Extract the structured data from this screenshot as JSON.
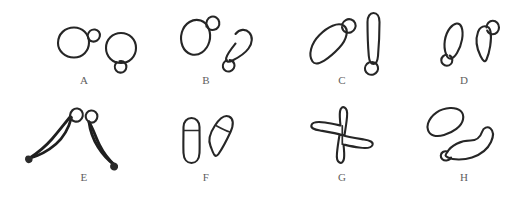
{
  "figure": {
    "background_color": "#ffffff",
    "ink_color": "#262626",
    "label_color": "#5e5e5e",
    "width": 530,
    "height": 197,
    "grid": {
      "rows": 2,
      "columns": 4
    }
  },
  "panels": [
    {
      "id": "A",
      "label": "A",
      "row": 0,
      "column": 0,
      "description": "Two rounded cells, each with a small bud: left cell bud at upper right, right cell bud at lower left",
      "objects": 2
    },
    {
      "id": "B",
      "label": "B",
      "row": 0,
      "column": 1,
      "description": "Two elongated oval cells tilted, each with a small terminal bud",
      "objects": 2
    },
    {
      "id": "C",
      "label": "C",
      "row": 0,
      "column": 2,
      "description": "A long diagonal spindle cell with apical knob and a vertical elongated cell with a basal round bud",
      "objects": 2
    },
    {
      "id": "D",
      "label": "D",
      "row": 0,
      "column": 3,
      "description": "Two small teardrop cells, left with basal bud, right with apical bud",
      "objects": 2
    },
    {
      "id": "E",
      "label": "E",
      "row": 1,
      "column": 0,
      "description": "Two spindle-shaped cells with pointed ends and small terminal knobs, arranged in a V",
      "objects": 2
    },
    {
      "id": "F",
      "label": "F",
      "row": 1,
      "column": 1,
      "description": "Two capsule-shaped cells each with a transverse cap line near the top",
      "objects": 2
    },
    {
      "id": "G",
      "label": "G",
      "row": 1,
      "column": 2,
      "description": "Two triangular lobed cells joined centrally forming a pinwheel",
      "objects": 2
    },
    {
      "id": "H",
      "label": "H",
      "row": 1,
      "column": 3,
      "description": "A kidney-shaped cell above and a curved crescent cell below with a small bud at its left end",
      "objects": 2
    }
  ]
}
